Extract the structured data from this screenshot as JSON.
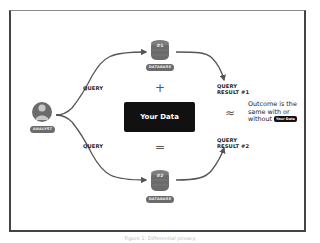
{
  "diagram": {
    "nodes": {
      "analyst": {
        "label": "ANALYST"
      },
      "database_1": {
        "number": "#1",
        "label": "DATABASE"
      },
      "database_2": {
        "number": "#2",
        "label": "DATABASE"
      },
      "your_data": {
        "label": "Your Data"
      }
    },
    "edges": {
      "query_top": "QUERY",
      "query_bottom": "QUERY",
      "result_1": "QUERY\nRESULT #1",
      "result_1_line1": "QUERY",
      "result_1_line2": "RESULT #1",
      "result_2_line1": "QUERY",
      "result_2_line2": "RESULT #2"
    },
    "operators": {
      "plus": "+",
      "equals": "=",
      "approx": "≈"
    },
    "outcome": {
      "line1": "Outcome is the",
      "line2": "same with or",
      "line3_prefix": "without",
      "badge": "Your Data"
    },
    "caption": "Figure 1: Differential privacy"
  },
  "colors": {
    "frame": "#444444",
    "node_gray": "#6b6b6b",
    "your_data_bg": "#111111",
    "wire": "#555555"
  }
}
